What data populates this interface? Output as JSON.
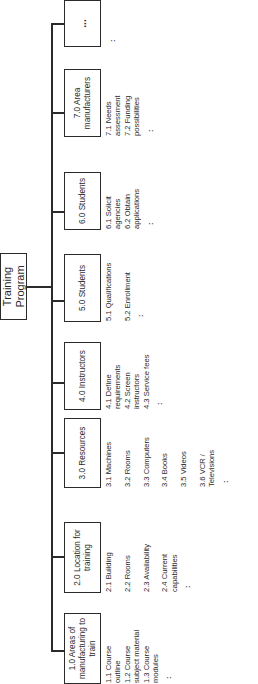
{
  "diagram": {
    "title": "Training Program",
    "title_lines": [
      "Training",
      "Program"
    ],
    "root_label": "Training Program",
    "nodes": [
      {
        "id": "1.0",
        "lines": [
          "1.0 Areas of",
          "manufacturing to",
          "train"
        ],
        "children": [
          "1.1 Course",
          "outline",
          "1.2 Course",
          "subject material",
          "1.3 Course",
          "modules"
        ],
        "more": ":"
      },
      {
        "id": "2.0",
        "lines": [
          "2.0 Location for",
          "training"
        ],
        "children": [
          "2.1 Building",
          "",
          "2.2 Rooms",
          "",
          "2.3 Availability",
          "",
          "2.4 Current",
          "capabilities"
        ],
        "more": ":"
      },
      {
        "id": "3.0",
        "lines": [
          "3.0 Resources"
        ],
        "children": [
          "3.1 Machines",
          "",
          "3.2 Rooms",
          "",
          "3.3 Computers",
          "",
          "3.4 Books",
          "",
          "3.5 Videos",
          "",
          "3.6 VCR /",
          "Televisions"
        ],
        "more": ":"
      },
      {
        "id": "4.0",
        "lines": [
          "4.0 Instructors"
        ],
        "children": [
          "4.1 Define",
          "requirements",
          "4.2 Screen",
          "instructors",
          "4.3 Service fees"
        ],
        "more": ":"
      },
      {
        "id": "5.0",
        "lines": [
          "5.0 Students"
        ],
        "children": [
          "5.1 Qualifications",
          "",
          "5.2 Enrollment"
        ],
        "more": ":"
      },
      {
        "id": "6.0",
        "lines": [
          "6.0 Students"
        ],
        "children": [
          "6.1 Solicit",
          "agencies",
          "6.2 Obtain",
          "applications"
        ],
        "more": ":"
      },
      {
        "id": "7.0",
        "lines": [
          "7.0 Area",
          "manufacturers"
        ],
        "children": [
          "7.1 Needs",
          "assessment",
          "7.2 Funding",
          "possibilities"
        ],
        "more": ":"
      },
      {
        "id": "more",
        "lines": [
          "..."
        ],
        "children": [],
        "more": ":"
      }
    ]
  }
}
